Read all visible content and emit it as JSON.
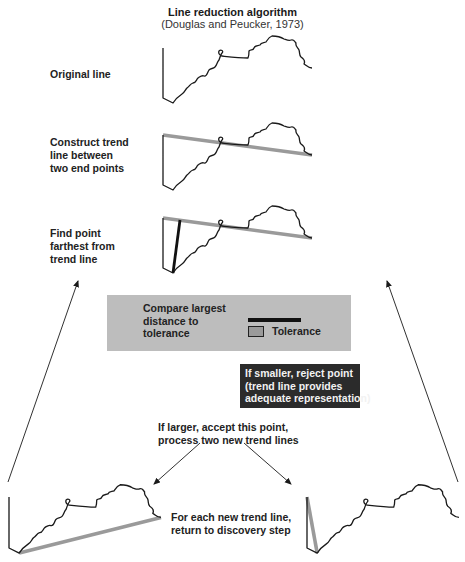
{
  "header": {
    "title": "Line reduction algorithm",
    "subtitle": "(Douglas and Peucker, 1973)"
  },
  "steps": [
    {
      "label_lines": [
        "Original line"
      ]
    },
    {
      "label_lines": [
        "Construct trend",
        "line between",
        "two end points"
      ]
    },
    {
      "label_lines": [
        "Find point",
        "farthest from",
        "trend line"
      ]
    }
  ],
  "compare_box": {
    "text_lines": [
      "Compare largest",
      "distance to",
      "tolerance"
    ],
    "legend": {
      "label": "Tolerance"
    }
  },
  "reject_box": {
    "text_lines": [
      "If smaller, reject point",
      "(trend line provides",
      "adequate representation)"
    ]
  },
  "accept_text": {
    "text_lines": [
      "If larger, accept this point,",
      "process two new trend lines"
    ]
  },
  "recurse_text": {
    "text_lines": [
      "For each new trend line,",
      "return to discovery step"
    ]
  },
  "colors": {
    "line": "#1a1a1a",
    "trend_line": "#9a9a9a",
    "compare_box_bg": "#bdbdbd",
    "reject_box_bg": "#2b2b2b",
    "reject_box_text": "#f2f2f2"
  }
}
